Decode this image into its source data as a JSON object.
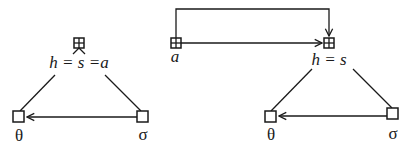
{
  "diagram": {
    "left": {
      "top_node": {
        "label": "h = s =a",
        "icon": "grid-node-icon"
      },
      "left_node": {
        "label": "θ",
        "icon": "square-node-icon"
      },
      "right_node": {
        "label": "σ",
        "icon": "square-node-icon"
      },
      "edges": [
        {
          "from": "top_node",
          "to": "left_node",
          "type": "line"
        },
        {
          "from": "top_node",
          "to": "right_node",
          "type": "line"
        },
        {
          "from": "right_node",
          "to": "left_node",
          "type": "arrow"
        }
      ]
    },
    "right": {
      "source_node": {
        "label": "a",
        "icon": "grid-node-icon"
      },
      "top_node": {
        "label": "h = s",
        "icon": "grid-node-icon"
      },
      "left_node": {
        "label": "θ",
        "icon": "square-node-icon"
      },
      "right_node": {
        "label": "σ",
        "icon": "square-node-icon"
      },
      "edges": [
        {
          "from": "source_node",
          "to": "top_node",
          "type": "arrow"
        },
        {
          "from": "source_node",
          "to": "top_node",
          "type": "arrow-loop-over"
        },
        {
          "from": "top_node",
          "to": "left_node",
          "type": "line"
        },
        {
          "from": "top_node",
          "to": "right_node",
          "type": "line"
        },
        {
          "from": "right_node",
          "to": "left_node",
          "type": "arrow"
        }
      ]
    }
  }
}
